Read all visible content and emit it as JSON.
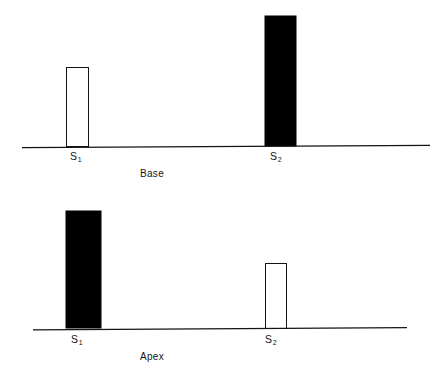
{
  "figure": {
    "background_color": "#ffffff",
    "line_color": "#141414",
    "fill_black": "#000000",
    "fill_open": "#ffffff"
  },
  "chart_data": [
    {
      "type": "bar",
      "title": "Base",
      "xlabel": "",
      "ylabel": "",
      "grid": false,
      "legend": null,
      "categories": [
        "S1",
        "S2"
      ],
      "tick_labels": [
        "S₁",
        "S₂"
      ],
      "values": [
        80,
        131
      ],
      "ylim": [
        0,
        147
      ],
      "bar_styles": [
        "open",
        "filled"
      ],
      "bars": [
        {
          "category": "S1",
          "label": "S₁",
          "value": 80,
          "style": "open",
          "x": 66,
          "width": 23
        },
        {
          "category": "S2",
          "label": "S₂",
          "value": 131,
          "style": "filled",
          "x": 265,
          "width": 31
        }
      ],
      "axis": {
        "x_start": 22,
        "x_end": 430,
        "baseline_y": 147
      }
    },
    {
      "type": "bar",
      "title": "Apex",
      "xlabel": "",
      "ylabel": "",
      "grid": false,
      "legend": null,
      "categories": [
        "S1",
        "S2"
      ],
      "tick_labels": [
        "S₁",
        "S₂"
      ],
      "values": [
        118,
        66
      ],
      "ylim": [
        0,
        137
      ],
      "bar_styles": [
        "filled",
        "open"
      ],
      "bars": [
        {
          "category": "S1",
          "label": "S₁",
          "value": 118,
          "style": "filled",
          "x": 66,
          "width": 35
        },
        {
          "category": "S2",
          "label": "S₂",
          "value": 66,
          "style": "open",
          "x": 265,
          "width": 22
        }
      ],
      "axis": {
        "x_start": 33,
        "x_end": 407,
        "baseline_y": 137
      }
    }
  ],
  "panels": {
    "base": {
      "caption": "Base",
      "tick_s1": "S",
      "tick_s1_sub": "1",
      "tick_s2": "S",
      "tick_s2_sub": "2"
    },
    "apex": {
      "caption": "Apex",
      "tick_s1": "S",
      "tick_s1_sub": "1",
      "tick_s2": "S",
      "tick_s2_sub": "2"
    }
  }
}
